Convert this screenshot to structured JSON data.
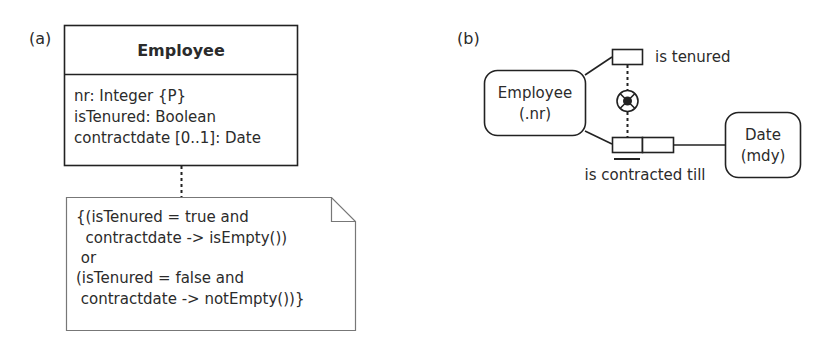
{
  "panel_a": {
    "label": "(a)",
    "class": {
      "name": "Employee",
      "attributes": [
        "nr: Integer {P}",
        "isTenured: Boolean",
        "contractdate [0..1]: Date"
      ]
    },
    "note": {
      "lines": [
        "{(isTenured = true and",
        "  contractdate -> isEmpty())",
        " or",
        "(isTenured = false and",
        " contractdate -> notEmpty())}"
      ]
    }
  },
  "panel_b": {
    "label": "(b)",
    "entities": [
      {
        "name": "Employee",
        "ref": "(.nr)"
      },
      {
        "name": "Date",
        "ref": "(mdy)"
      }
    ],
    "predicates": [
      {
        "reading": "is tenured",
        "arity": 1
      },
      {
        "reading": "is contracted till",
        "arity": 2,
        "uniqueness": "first-role"
      }
    ],
    "constraint": {
      "type": "exclusive-or",
      "icon": "xor-constraint-icon"
    }
  }
}
